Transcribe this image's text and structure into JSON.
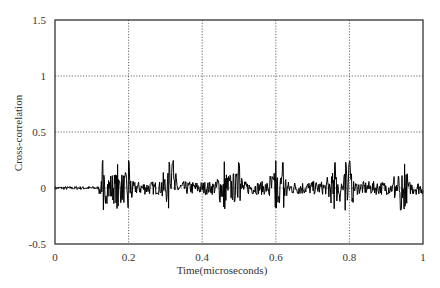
{
  "chart_data": {
    "type": "line",
    "title": "",
    "xlabel": "Time(microseconds)",
    "ylabel": "Cross-correlation",
    "xlim": [
      0,
      1
    ],
    "ylim": [
      -0.5,
      1.5
    ],
    "xticks": [
      0,
      0.2,
      0.4,
      0.6,
      0.8,
      1
    ],
    "xtick_labels": [
      "0",
      "0.2",
      "0.4",
      "0.6",
      "0.8",
      "1"
    ],
    "yticks": [
      -0.5,
      0,
      0.5,
      1,
      1.5
    ],
    "ytick_labels": [
      "-0.5",
      "0",
      "0.5",
      "1",
      "1.5"
    ],
    "grid": true,
    "grid_style": "dotted",
    "legend": null,
    "line_color": "#000000",
    "series": [
      {
        "name": "cross-correlation",
        "description": "Noisy signal near 0; quiet baseline (~±0.02) from 0 to ~0.12, then bursts of oscillation with peaks up to ~0.25 and troughs down to ~-0.2",
        "x": [
          0,
          0.05,
          0.1,
          0.12,
          0.14,
          0.16,
          0.18,
          0.2,
          0.22,
          0.25,
          0.28,
          0.3,
          0.32,
          0.35,
          0.4,
          0.42,
          0.45,
          0.48,
          0.5,
          0.55,
          0.6,
          0.62,
          0.65,
          0.7,
          0.75,
          0.78,
          0.8,
          0.85,
          0.9,
          0.93,
          0.95,
          1.0
        ],
        "y": [
          0.0,
          0.01,
          0.0,
          0.03,
          0.12,
          -0.12,
          0.15,
          -0.15,
          0.1,
          0.05,
          -0.1,
          0.25,
          -0.15,
          0.05,
          0.0,
          0.1,
          -0.18,
          0.12,
          -0.17,
          0.05,
          -0.2,
          0.22,
          -0.1,
          0.05,
          0.12,
          -0.18,
          0.15,
          0.05,
          0.05,
          0.22,
          -0.18,
          0.02
        ]
      }
    ],
    "burst_envelope": {
      "quiet_until": 0.12,
      "max_peak": 0.25,
      "min_trough": -0.2,
      "major_spikes_x": [
        0.13,
        0.17,
        0.2,
        0.31,
        0.32,
        0.46,
        0.5,
        0.6,
        0.62,
        0.76,
        0.79,
        0.8,
        0.94,
        0.95
      ]
    }
  }
}
